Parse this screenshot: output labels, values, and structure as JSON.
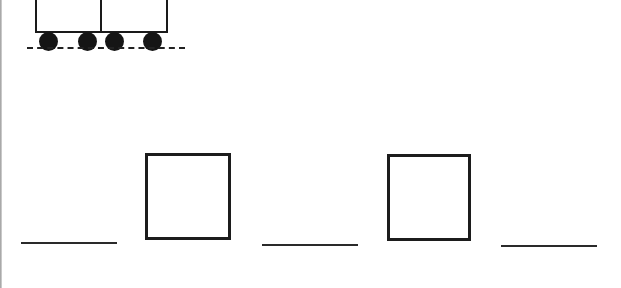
{
  "worksheet": {
    "illustration": {
      "type": "train",
      "cars": 2,
      "wheels": 4,
      "track_style": "dashed"
    },
    "answer_row": {
      "items": [
        {
          "kind": "blank-line",
          "value": ""
        },
        {
          "kind": "box",
          "value": ""
        },
        {
          "kind": "blank-line",
          "value": ""
        },
        {
          "kind": "box",
          "value": ""
        },
        {
          "kind": "blank-line",
          "value": ""
        }
      ]
    },
    "colors": {
      "ink": "#1a1a1a",
      "background": "#ffffff"
    }
  }
}
